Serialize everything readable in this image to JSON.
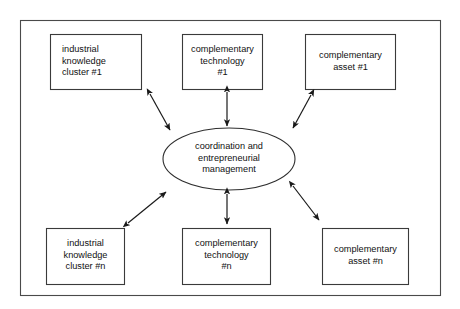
{
  "diagram": {
    "type": "hub-and-spoke",
    "frame": {
      "name": "outer-border"
    },
    "hub": {
      "shape": "ellipse",
      "label": "coordination and\nentrepreneurial\nmanagement",
      "lines": [
        "coordination and",
        "entrepreneurial",
        "management"
      ]
    },
    "nodes": [
      {
        "id": "industrial-knowledge-cluster-1",
        "label": "industrial\nknowledge\ncluster #1",
        "lines": [
          "industrial",
          "knowledge",
          "cluster #1"
        ],
        "align": "left",
        "position": "top-left"
      },
      {
        "id": "complementary-technology-1",
        "label": "complementary\ntechnology\n#1",
        "lines": [
          "complementary",
          "technology",
          "#1"
        ],
        "align": "center",
        "position": "top-center"
      },
      {
        "id": "complementary-asset-1",
        "label": "complementary\nasset #1",
        "lines": [
          "complementary",
          "asset #1"
        ],
        "align": "center",
        "position": "top-right"
      },
      {
        "id": "industrial-knowledge-cluster-n",
        "label": "industrial\nknowledge\ncluster #n",
        "lines": [
          "industrial",
          "knowledge",
          "cluster #n"
        ],
        "align": "center",
        "position": "bottom-left"
      },
      {
        "id": "complementary-technology-n",
        "label": "complementary\ntechnology\n#n",
        "lines": [
          "complementary",
          "technology",
          "#n"
        ],
        "align": "center",
        "position": "bottom-center"
      },
      {
        "id": "complementary-asset-n",
        "label": "complementary\nasset #n",
        "lines": [
          "complementary",
          "asset #n"
        ],
        "align": "center",
        "position": "bottom-right"
      }
    ],
    "connectors": [
      {
        "id": "hub-to-industrial-knowledge-cluster-1",
        "style": "double-arrow"
      },
      {
        "id": "hub-to-complementary-technology-1",
        "style": "double-arrow"
      },
      {
        "id": "hub-to-complementary-asset-1",
        "style": "double-arrow"
      },
      {
        "id": "hub-to-industrial-knowledge-cluster-n",
        "style": "double-arrow"
      },
      {
        "id": "hub-to-complementary-technology-n",
        "style": "double-arrow"
      },
      {
        "id": "hub-to-complementary-asset-n",
        "style": "double-arrow"
      }
    ],
    "colors": {
      "background": "#ffffff",
      "stroke": "#2e2e2e",
      "frame_stroke": "#4a4a4a",
      "text": "#111111"
    }
  }
}
